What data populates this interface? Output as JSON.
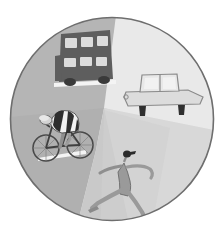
{
  "illustration": {
    "title": "Transport Modes Circle",
    "shape": "circle",
    "canvas": {
      "width": 224,
      "height": 238
    },
    "circle": {
      "cx": 112,
      "cy": 119,
      "r": 102
    },
    "outline_color": "#6e6e6e",
    "background_color": "#ffffff",
    "segments": [
      {
        "id": "upper-left",
        "name": "bus-segment",
        "label": "Bus",
        "fill": "#b5b5b5"
      },
      {
        "id": "upper-right",
        "name": "car-segment",
        "label": "Car",
        "fill": "#e9e9e9"
      },
      {
        "id": "lower-left",
        "name": "cyclist-segment",
        "label": "Cyclist",
        "fill": "#b0b0b0"
      },
      {
        "id": "lower-right",
        "name": "runner-segment",
        "label": "Runner",
        "fill": "#d8d8d8"
      },
      {
        "id": "center-wedge",
        "name": "center-wedge-segment",
        "label": "Center Wedge",
        "fill": "#c4c4c4"
      }
    ],
    "subjects": [
      {
        "id": "bus",
        "name": "double-decker-bus",
        "label": "Double-decker bus",
        "body_fill": "#5e5e5e",
        "window_fill": "#dcdcdc",
        "wheel_fill": "#3a3a3a",
        "ground_fill": "#f2f2f2",
        "window_count": 6,
        "deck_count": 2
      },
      {
        "id": "car",
        "name": "car",
        "label": "Car",
        "body_fill": "#dcdcdc",
        "outline": "#8a8a8a",
        "window_fill": "#eeeeee",
        "wheel_fill": "#2f2f2f",
        "window_count": 2
      },
      {
        "id": "cyclist",
        "name": "cyclist-on-bicycle",
        "label": "Cyclist on bicycle",
        "jersey_stripe_dark": "#2e2e2e",
        "jersey_stripe_light": "#f0f0f0",
        "skin_fill": "#cfcfcf",
        "frame_color": "#4a4a4a",
        "ground_fill": "#f2f2f2",
        "wheel_count": 2
      },
      {
        "id": "runner",
        "name": "running-figure",
        "label": "Running figure",
        "body_fill": "#9a9a9a",
        "outline": "#6a6a6a",
        "head_fill": "#2b2b2b"
      }
    ]
  }
}
